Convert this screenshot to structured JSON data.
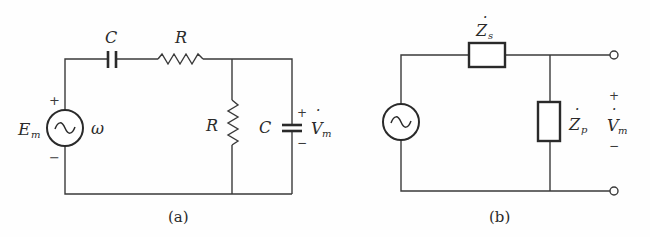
{
  "figure": {
    "panels": [
      {
        "id": "a",
        "caption": "(a)",
        "source": {
          "label": "E",
          "label_sub": "m",
          "frequency_label": "ω",
          "plus": "+",
          "minus": "−",
          "symbol": "~"
        },
        "series_capacitor": {
          "label": "C"
        },
        "series_resistor": {
          "label": "R"
        },
        "shunt_resistor": {
          "label": "R"
        },
        "shunt_capacitor": {
          "label": "C"
        },
        "output": {
          "label": "V",
          "label_sub": "m",
          "dot": "·",
          "plus": "+",
          "minus": "−"
        }
      },
      {
        "id": "b",
        "caption": "(b)",
        "source": {
          "symbol": "~"
        },
        "series_impedance": {
          "label": "Z",
          "label_sub": "s",
          "dot": "·"
        },
        "shunt_impedance": {
          "label": "Z",
          "label_sub": "p",
          "dot": "·"
        },
        "output": {
          "label": "V",
          "label_sub": "m",
          "dot": "·",
          "plus": "+",
          "minus": "−"
        }
      }
    ]
  },
  "colors": {
    "line": "#3a3a3a",
    "text": "#2a2a2a",
    "background": "#fefefe"
  }
}
